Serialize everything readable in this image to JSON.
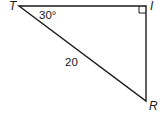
{
  "figure": {
    "type": "right-triangle",
    "vertices": [
      {
        "name": "T",
        "label": "T"
      },
      {
        "name": "I",
        "label": "I"
      },
      {
        "name": "R",
        "label": "R"
      }
    ],
    "angle_label": "30°",
    "angle_at": "T",
    "right_angle_at": "I",
    "side_label": "20",
    "side": "TR",
    "colors": {
      "stroke": "#1a1a1a",
      "background": "#ffffff"
    }
  }
}
